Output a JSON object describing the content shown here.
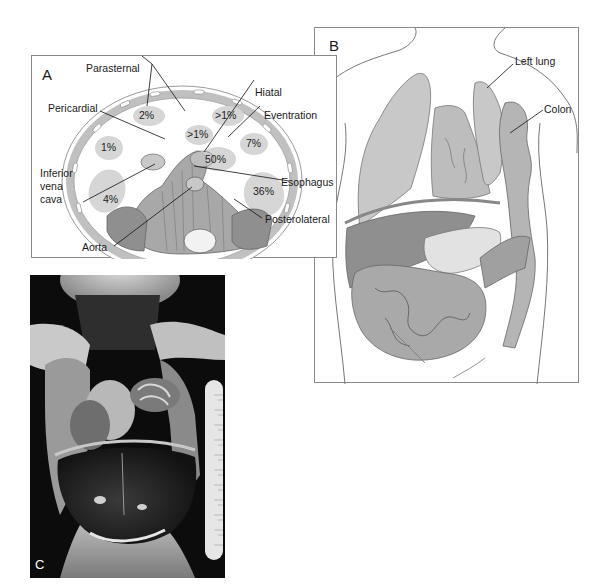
{
  "figure": {
    "panels": [
      {
        "id": "A",
        "label": "A",
        "description": "Diaphragm viewed from above showing locations and frequencies of congenital diaphragmatic hernias",
        "defects": [
          {
            "name": "Parasternal",
            "percent": "2%"
          },
          {
            "name": "Parasternal",
            "percent": ">1%"
          },
          {
            "name": "Pericardial",
            "percent": ">1%"
          },
          {
            "name": "Unlabeled",
            "percent": "1%"
          },
          {
            "name": "Hiatal",
            "percent": "50%"
          },
          {
            "name": "Eventration",
            "percent": "7%"
          },
          {
            "name": "Posterolateral",
            "percent": "36%"
          },
          {
            "name": "Unlabeled",
            "percent": "4%"
          }
        ],
        "labels": {
          "parasternal": "Parasternal",
          "pericardial": "Pericardial",
          "hiatal": "Hiatal",
          "eventration": "Eventration",
          "inferior_vena_cava_line1": "Inferior",
          "inferior_vena_cava_line2": "vena",
          "inferior_vena_cava_line3": "cava",
          "esophagus": "Esophagus",
          "posterolateral": "Posterolateral",
          "aorta": "Aorta"
        },
        "percents": {
          "parasternal_left": "2%",
          "parasternal_right": ">1%",
          "pericardial": ">1%",
          "left_anterior": "1%",
          "hiatal": "50%",
          "eventration": "7%",
          "posterolateral": "36%",
          "left_posterior": "4%"
        }
      },
      {
        "id": "B",
        "label": "B",
        "description": "Torso illustration showing colon herniated into left thorax",
        "labels": {
          "left_lung": "Left lung",
          "colon": "Colon"
        }
      },
      {
        "id": "C",
        "label": "C",
        "description": "Autopsy photograph of infant with diaphragmatic hernia and ruler for scale"
      }
    ]
  },
  "colors": {
    "border": "#8a8a8a",
    "organ_fill": "#c4c4c4",
    "organ_dark": "#8f8f8f",
    "defect_spot": "#d6d6d6",
    "rib_ring": "#b8b8b8",
    "photo_bg": "#0c0c0c"
  }
}
